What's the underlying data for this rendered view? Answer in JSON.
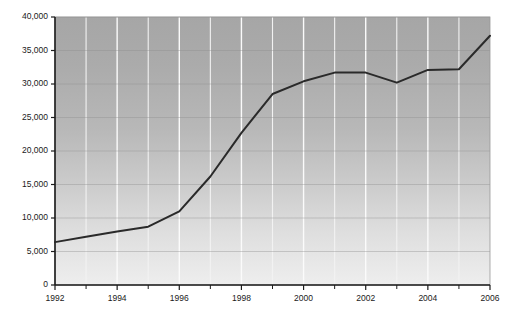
{
  "chart_data": {
    "type": "line",
    "title": "",
    "subtitle": "",
    "xlabel": "",
    "ylabel": "",
    "x": [
      1992,
      1993,
      1994,
      1995,
      1996,
      1997,
      1998,
      1999,
      2000,
      2001,
      2002,
      2003,
      2004,
      2005,
      2006
    ],
    "values": [
      6400,
      7200,
      8000,
      8700,
      11000,
      16200,
      22700,
      28500,
      30400,
      31700,
      31700,
      30200,
      32100,
      32200,
      37200
    ],
    "series": [
      {
        "name": "",
        "values": [
          6400,
          7200,
          8000,
          8700,
          11000,
          16200,
          22700,
          28500,
          30400,
          31700,
          31700,
          30200,
          32100,
          32200,
          37200
        ]
      }
    ],
    "xlim": [
      1992,
      2006
    ],
    "ylim": [
      0,
      40000
    ],
    "y_ticks": [
      0,
      5000,
      10000,
      15000,
      20000,
      25000,
      30000,
      35000,
      40000
    ],
    "y_tick_labels": [
      "0",
      "5,000",
      "10,000",
      "15,000",
      "20,000",
      "25,000",
      "30,000",
      "35,000",
      "40,000"
    ],
    "x_ticks": [
      1992,
      1993,
      1994,
      1995,
      1996,
      1997,
      1998,
      1999,
      2000,
      2001,
      2002,
      2003,
      2004,
      2005,
      2006
    ],
    "x_tick_labels_major": [
      "1992",
      "1994",
      "1996",
      "1998",
      "2000",
      "2002",
      "2004",
      "2006"
    ],
    "x_ticks_major": [
      1992,
      1994,
      1996,
      1998,
      2000,
      2002,
      2004,
      2006
    ],
    "grid": {
      "horizontal": true,
      "vertical": true
    },
    "legend": {
      "visible": false,
      "position": "none",
      "entries": []
    },
    "annotations": [],
    "colors": {
      "line": "#2a2a2a",
      "plot_background_top": "#a9a9a9",
      "plot_background_bottom": "#ececec",
      "page_background": "#ffffff",
      "axis": "#1c1c1c",
      "grid_vertical": "#fbfbfb",
      "grid_horizontal": "#8e8e8e",
      "tick_text": "#1a1a1a"
    }
  }
}
